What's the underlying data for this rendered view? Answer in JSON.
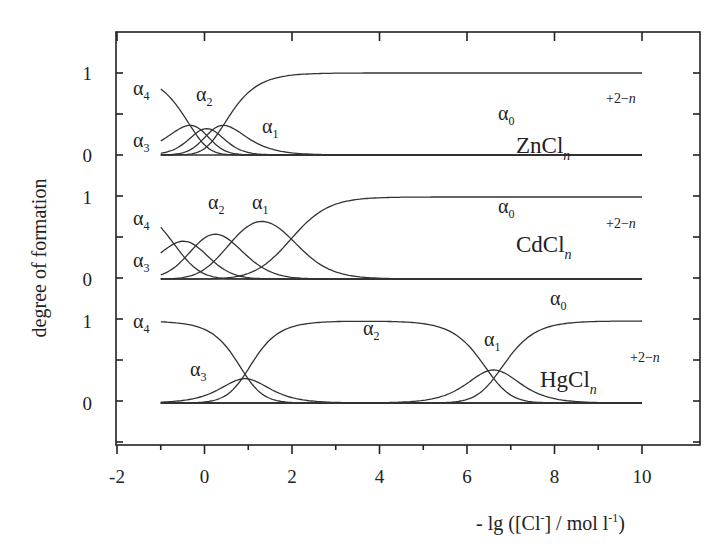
{
  "chart_data": {
    "type": "line",
    "title": "",
    "xlabel": "- lg ([Cl⁻] / mol l⁻¹)",
    "xlabel_parts": {
      "prefix": "- lg ([Cl",
      "sup1": "-",
      "mid": "] / mol l",
      "sup2": "-1",
      "suffix": ")"
    },
    "ylabel": "degree of formation",
    "xlim": [
      -2,
      11.3
    ],
    "x_ticks": [
      -2,
      0,
      2,
      4,
      6,
      8,
      10
    ],
    "x_tick_labels": [
      "-2",
      "0",
      "2",
      "4",
      "6",
      "8",
      "10"
    ],
    "x_minor_ticks": [
      -1,
      1,
      3,
      5,
      7,
      9
    ],
    "grid": false,
    "legend": "inline labels",
    "x_range_of_curves": [
      -1,
      10
    ],
    "panels": [
      {
        "species": {
          "base": "ZnCl",
          "sub": "n",
          "sup": "+2−",
          "sup_n": "n"
        },
        "y_tick_labels": [
          "1",
          "0"
        ],
        "ylim": [
          -0.4,
          1.4
        ],
        "log_beta": [
          0,
          0.43,
          0.61,
          0.53,
          0.2
        ],
        "series": [
          {
            "name": "α0",
            "label": "α",
            "sub": "0",
            "description": "free Zn2+, rises to 1 by x≈2"
          },
          {
            "name": "α1",
            "label": "α",
            "sub": "1",
            "peak_x": 0.4,
            "peak_y": 0.3
          },
          {
            "name": "α2",
            "label": "α",
            "sub": "2",
            "peak_x": 0.0,
            "peak_y": 0.55
          },
          {
            "name": "α3",
            "label": "α",
            "sub": "3",
            "peak_x": -0.4,
            "peak_y": 0.3
          },
          {
            "name": "α4",
            "label": "α",
            "sub": "4",
            "at_x_-1": 0.78
          }
        ]
      },
      {
        "species": {
          "base": "CdCl",
          "sub": "n",
          "sup": "+2−",
          "sup_n": "n"
        },
        "y_tick_labels": [
          "1",
          "0"
        ],
        "ylim": [
          -0.4,
          1.4
        ],
        "log_beta": [
          0,
          1.98,
          2.6,
          2.4,
          1.7
        ],
        "series": [
          {
            "name": "α0",
            "label": "α",
            "sub": "0"
          },
          {
            "name": "α1",
            "label": "α",
            "sub": "1",
            "peak_x": 1.3,
            "peak_y": 0.72
          },
          {
            "name": "α2",
            "label": "α",
            "sub": "2",
            "peak_x": 0.25,
            "peak_y": 0.55
          },
          {
            "name": "α3",
            "label": "α",
            "sub": "3",
            "peak_x": -0.5,
            "peak_y": 0.45
          },
          {
            "name": "α4",
            "label": "α",
            "sub": "4"
          }
        ]
      },
      {
        "species": {
          "base": "HgCl",
          "sub": "n",
          "sup": "+2−",
          "sup_n": "n"
        },
        "y_tick_labels": [
          "1",
          "0"
        ],
        "ylim": [
          -0.4,
          1.4
        ],
        "log_beta": [
          0,
          6.74,
          13.22,
          14.07,
          15.07
        ],
        "series": [
          {
            "name": "α0",
            "label": "α",
            "sub": "0"
          },
          {
            "name": "α1",
            "label": "α",
            "sub": "1",
            "peak_x": 6.6,
            "peak_y": 0.32
          },
          {
            "name": "α2",
            "label": "α",
            "sub": "2",
            "plateau_x": [
              2,
              6
            ],
            "plateau_y": 1.0
          },
          {
            "name": "α3",
            "label": "α",
            "sub": "3",
            "peak_x": 0.9,
            "peak_y": 0.3
          },
          {
            "name": "α4",
            "label": "α",
            "sub": "4",
            "at_x_-1": 1.0
          }
        ]
      }
    ]
  }
}
